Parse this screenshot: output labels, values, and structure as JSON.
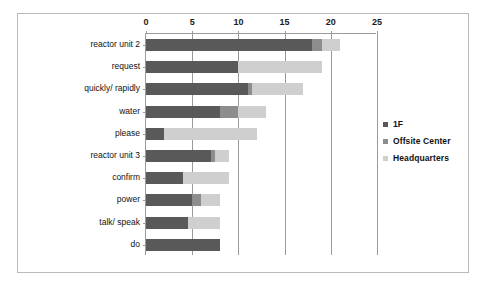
{
  "chart_data": {
    "type": "bar",
    "orientation": "horizontal",
    "stacked": true,
    "title": "",
    "xlabel": "",
    "ylabel": "",
    "xlim": [
      0,
      25
    ],
    "xticks": [
      0,
      5,
      10,
      15,
      20,
      25
    ],
    "xtick_labels": [
      "0",
      "5",
      "10",
      "15",
      "20",
      "25"
    ],
    "grid": true,
    "legend_position": "right",
    "categories": [
      "reactor unit 2",
      "request",
      "quickly/ rapidly",
      "water",
      "please",
      "reactor unit 3",
      "confirm",
      "power",
      "talk/ speak",
      "do"
    ],
    "series": [
      {
        "name": "1F",
        "color": "#595959",
        "values": [
          18,
          10,
          11,
          8,
          2,
          7,
          4,
          5,
          4.5,
          8
        ]
      },
      {
        "name": "Offsite Center",
        "color": "#8d8d8d",
        "values": [
          1,
          0,
          0.5,
          2,
          0,
          0.5,
          0,
          1,
          0,
          0
        ]
      },
      {
        "name": "Headquarters",
        "color": "#cfcfcf",
        "values": [
          2,
          9,
          5.5,
          3,
          10,
          1.5,
          5,
          2,
          3.5,
          0
        ]
      }
    ],
    "totals": [
      21,
      19,
      17,
      13,
      12,
      9,
      9,
      8,
      8,
      8
    ]
  },
  "legend": {
    "items": [
      {
        "label": "1F",
        "color": "#595959"
      },
      {
        "label": "Offsite Center",
        "color": "#8d8d8d"
      },
      {
        "label": "Headquarters",
        "color": "#cfcfcf"
      }
    ]
  }
}
